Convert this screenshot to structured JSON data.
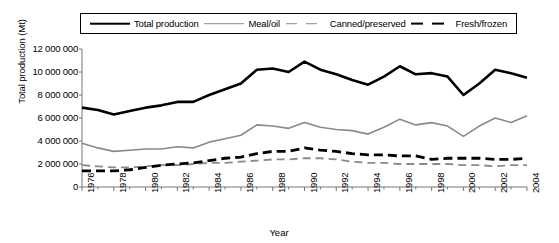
{
  "chart_data": {
    "type": "line",
    "title": "",
    "xlabel": "Year",
    "ylabel": "Total production (Mt)",
    "xlim": [
      1976,
      2004
    ],
    "ylim": [
      0,
      12000000
    ],
    "ytick_labels": [
      "12 000 000",
      "10 000 000",
      "8 000 000",
      "6 000 000",
      "4 000 000",
      "2 000 000",
      "0"
    ],
    "ytick_values": [
      12000000,
      10000000,
      8000000,
      6000000,
      4000000,
      2000000,
      0
    ],
    "xtick_labels": [
      "1976",
      "1978",
      "1980",
      "1982",
      "1984",
      "1986",
      "1988",
      "1990",
      "1992",
      "1994",
      "1996",
      "1998",
      "2000",
      "2002",
      "2004"
    ],
    "xtick_values": [
      1976,
      1978,
      1980,
      1982,
      1984,
      1986,
      1988,
      1990,
      1992,
      1994,
      1996,
      1998,
      2000,
      2002,
      2004
    ],
    "x": [
      1976,
      1977,
      1978,
      1979,
      1980,
      1981,
      1982,
      1983,
      1984,
      1985,
      1986,
      1987,
      1988,
      1989,
      1990,
      1991,
      1992,
      1993,
      1994,
      1995,
      1996,
      1997,
      1998,
      1999,
      2000,
      2001,
      2002,
      2003,
      2004
    ],
    "grid": false,
    "legend_position": "top",
    "series": [
      {
        "name": "Total production",
        "color": "#000000",
        "style": "solid",
        "width": 2.6,
        "values": [
          6900000,
          6700000,
          6300000,
          6600000,
          6900000,
          7100000,
          7400000,
          7400000,
          8000000,
          8500000,
          9000000,
          10200000,
          10300000,
          10000000,
          10900000,
          10200000,
          9800000,
          9300000,
          8900000,
          9600000,
          10500000,
          9800000,
          9900000,
          9600000,
          8000000,
          9000000,
          10200000,
          9900000,
          9500000
        ]
      },
      {
        "name": "Meal/oil",
        "color": "#8a8a8a",
        "style": "solid",
        "width": 1.6,
        "values": [
          3800000,
          3400000,
          3100000,
          3200000,
          3300000,
          3300000,
          3500000,
          3400000,
          3900000,
          4200000,
          4500000,
          5400000,
          5300000,
          5100000,
          5600000,
          5200000,
          5000000,
          4900000,
          4600000,
          5200000,
          5900000,
          5400000,
          5600000,
          5300000,
          4400000,
          5300000,
          6000000,
          5600000,
          6200000
        ]
      },
      {
        "name": "Canned/preserved",
        "color": "#8a8a8a",
        "style": "dashed",
        "width": 1.8,
        "values": [
          1900000,
          1800000,
          1700000,
          1700000,
          1800000,
          1900000,
          1900000,
          2000000,
          2100000,
          2100000,
          2200000,
          2300000,
          2400000,
          2400000,
          2500000,
          2500000,
          2400000,
          2200000,
          2100000,
          2100000,
          2000000,
          2000000,
          2000000,
          2000000,
          1900000,
          1900000,
          1800000,
          1900000,
          1900000
        ]
      },
      {
        "name": "Fresh/frozen",
        "color": "#000000",
        "style": "dashed",
        "width": 2.8,
        "values": [
          1400000,
          1400000,
          1400000,
          1500000,
          1700000,
          1900000,
          2000000,
          2100000,
          2300000,
          2500000,
          2600000,
          2900000,
          3100000,
          3100000,
          3400000,
          3200000,
          3100000,
          2900000,
          2800000,
          2800000,
          2700000,
          2700000,
          2400000,
          2500000,
          2500000,
          2500000,
          2400000,
          2400000,
          2500000
        ]
      }
    ]
  },
  "legend": {
    "items": [
      {
        "label": "Total production",
        "key": "solid-black-key"
      },
      {
        "label": "Meal/oil",
        "key": "solid-gray-key"
      },
      {
        "label": "Canned/preserved",
        "key": "dashed-gray-key"
      },
      {
        "label": "Fresh/frozen",
        "key": "dashed-black-key"
      }
    ]
  }
}
